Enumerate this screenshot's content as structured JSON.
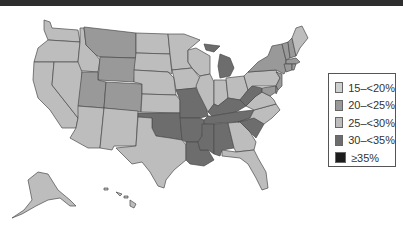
{
  "colors": {
    "c15_20": "#cfcfcf",
    "c20_25": "#999999",
    "c25_30": "#bdbdbd",
    "c30_35": "#6d6d6d",
    "c35plus": "#1c1c1c"
  },
  "legend": {
    "items": [
      {
        "label": "15–<20%",
        "color": "#cfcfcf"
      },
      {
        "label": "20–<25%",
        "color": "#999999"
      },
      {
        "label": "25–<30%",
        "color": "#bdbdbd"
      },
      {
        "label": "30–<35%",
        "color": "#6d6d6d"
      },
      {
        "label": "≥35%",
        "color": "#1c1c1c"
      }
    ]
  },
  "map": {
    "type": "choropleth",
    "region": "United States",
    "categories": {
      "15-<20%": [],
      "20-<25%": [
        "MT",
        "WY",
        "UT",
        "CO",
        "NY",
        "VT",
        "NH",
        "MA",
        "CT",
        "RI",
        "NJ",
        "MD",
        "DE"
      ],
      "25-<30%": [
        "WA",
        "OR",
        "CA",
        "ID",
        "NV",
        "AZ",
        "NM",
        "ND",
        "SD",
        "NE",
        "KS",
        "MN",
        "WI",
        "IA",
        "IL",
        "IN",
        "OH",
        "PA",
        "ME",
        "VA",
        "NC",
        "GA",
        "FL",
        "TX",
        "AK",
        "HI"
      ],
      "30-<35%": [
        "OK",
        "MO",
        "AR",
        "LA",
        "MS",
        "AL",
        "TN",
        "KY",
        "WV",
        "MI",
        "SC"
      ],
      ">=35%": []
    }
  }
}
